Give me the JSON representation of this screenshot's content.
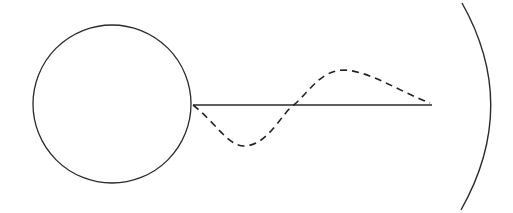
{
  "diagram": {
    "background": "#ffffff",
    "stroke_color": "#2a2a2a",
    "circle": {
      "cx": 112,
      "cy": 104,
      "r": 79
    },
    "axis_line": {
      "x1": 193,
      "y1": 105,
      "x2": 432,
      "y2": 105
    },
    "wave_path": "M193,105 C215,122 228,146 244,146 C268,146 282,112 295,104 C312,88 322,70 345,70 C372,72 400,92 430,103",
    "mirror_arc": "M462,3 Q520,106 461,210"
  }
}
